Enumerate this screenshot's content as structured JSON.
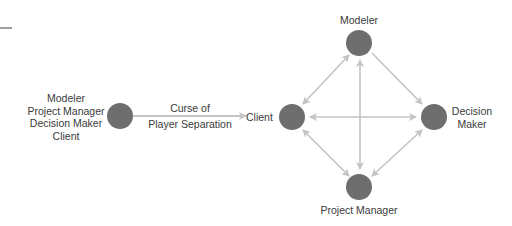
{
  "left_group": {
    "labels": [
      "Modeler",
      "Project Manager",
      "Decision Maker",
      "Client"
    ]
  },
  "arrow_label": {
    "line1": "Curse of",
    "line2": "Player Separation"
  },
  "nodes": {
    "client": "Client",
    "modeler": "Modeler",
    "decision_maker_1": "Decision",
    "decision_maker_2": "Maker",
    "project_manager": "Project Manager"
  },
  "colors": {
    "node": "#6e6e6e",
    "edge": "#c4c4c4",
    "text": "#3a3a3a"
  }
}
